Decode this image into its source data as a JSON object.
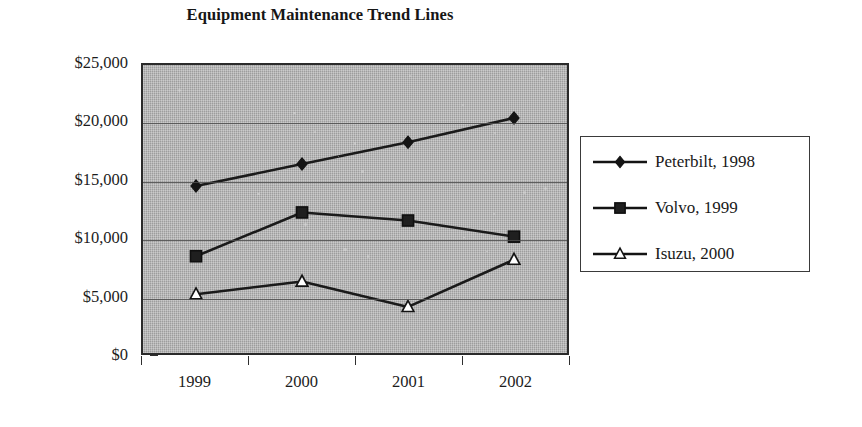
{
  "chart_data": {
    "type": "line",
    "title": "Equipment Maintenance Trend Lines",
    "xlabel": "",
    "ylabel": "",
    "categories": [
      "1999",
      "2000",
      "2001",
      "2002"
    ],
    "ylim": [
      0,
      25000
    ],
    "ytick_labels": [
      "$25,000",
      "$20,000",
      "$15,000",
      "$10,000",
      "$5,000",
      "$0"
    ],
    "ytick_values": [
      25000,
      20000,
      15000,
      10000,
      5000,
      0
    ],
    "grid": true,
    "legend_position": "right",
    "plot_background_color": "#a7a7a7",
    "series": [
      {
        "name": "Peterbilt, 1998",
        "marker": "diamond-filled",
        "color": "#1a1a1a",
        "values": [
          14500,
          16400,
          18300,
          20400
        ]
      },
      {
        "name": "Volvo, 1999",
        "marker": "square-filled",
        "color": "#1a1a1a",
        "values": [
          8400,
          12200,
          11500,
          10100
        ]
      },
      {
        "name": "Isuzu, 2000",
        "marker": "triangle-open",
        "color": "#1a1a1a",
        "values": [
          5100,
          6200,
          4000,
          8100
        ]
      }
    ]
  },
  "legend": {
    "entries": [
      {
        "label": "Peterbilt, 1998",
        "marker": "diamond-filled"
      },
      {
        "label": "Volvo, 1999",
        "marker": "square-filled"
      },
      {
        "label": "Isuzu, 2000",
        "marker": "triangle-open"
      }
    ]
  }
}
